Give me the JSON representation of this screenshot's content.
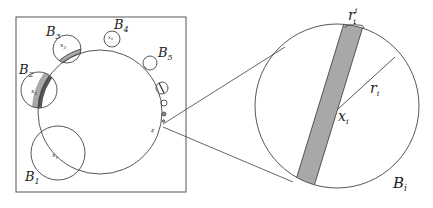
{
  "figure": {
    "left_panel": {
      "balls": [
        {
          "label": "B",
          "sub": "1",
          "center_label": "x",
          "center_sub": "1",
          "shaded": false
        },
        {
          "label": "B",
          "sub": "2",
          "center_label": "x",
          "center_sub": "2",
          "shaded": true
        },
        {
          "label": "B",
          "sub": "3",
          "center_label": "x",
          "center_sub": "3",
          "shaded": true
        },
        {
          "label": "B",
          "sub": "4",
          "center_label": "x",
          "center_sub": "4",
          "shaded": true
        },
        {
          "label": "B",
          "sub": "5",
          "center_label": "",
          "center_sub": "",
          "shaded": true
        }
      ],
      "limit_point_label": "z"
    },
    "right_panel": {
      "ball_label": "B",
      "ball_sub": "i",
      "center_label": "x",
      "center_sub": "i",
      "radius_label": "r",
      "radius_sub": "i",
      "width_label": "r",
      "width_sub": "i",
      "width_sup": "i"
    },
    "colors": {
      "stroke": "#333333",
      "shade": "#a8a8a8"
    }
  }
}
